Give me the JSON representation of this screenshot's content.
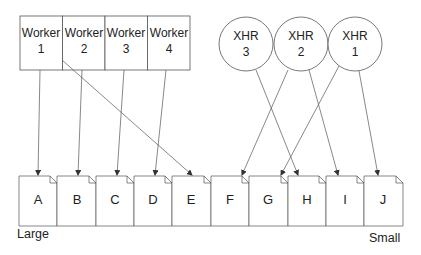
{
  "diagram": {
    "workers": [
      {
        "id": "w1",
        "line1": "Worker",
        "line2": "1"
      },
      {
        "id": "w2",
        "line1": "Worker",
        "line2": "2"
      },
      {
        "id": "w3",
        "line1": "Worker",
        "line2": "3"
      },
      {
        "id": "w4",
        "line1": "Worker",
        "line2": "4"
      }
    ],
    "xhrs": [
      {
        "id": "x3",
        "line1": "XHR",
        "line2": "3"
      },
      {
        "id": "x2",
        "line1": "XHR",
        "line2": "2"
      },
      {
        "id": "x1",
        "line1": "XHR",
        "line2": "1"
      }
    ],
    "documents": [
      {
        "label": "A"
      },
      {
        "label": "B"
      },
      {
        "label": "C"
      },
      {
        "label": "D"
      },
      {
        "label": "E"
      },
      {
        "label": "F"
      },
      {
        "label": "G"
      },
      {
        "label": "H"
      },
      {
        "label": "I"
      },
      {
        "label": "J"
      }
    ],
    "edges": [
      {
        "from": "Worker 1",
        "to": "A"
      },
      {
        "from": "Worker 2",
        "to": "B"
      },
      {
        "from": "Worker 3",
        "to": "C"
      },
      {
        "from": "Worker 4",
        "to": "D"
      },
      {
        "from": "Worker 1",
        "to": "E"
      },
      {
        "from": "XHR 3",
        "to": "H"
      },
      {
        "from": "XHR 2",
        "to": "F"
      },
      {
        "from": "XHR 2",
        "to": "I"
      },
      {
        "from": "XHR 1",
        "to": "G"
      },
      {
        "from": "XHR 1",
        "to": "J"
      }
    ],
    "scale": {
      "left_label": "Large",
      "right_label": "Small"
    },
    "colors": {
      "stroke": "#555555",
      "text": "#222222",
      "background": "#ffffff"
    }
  }
}
